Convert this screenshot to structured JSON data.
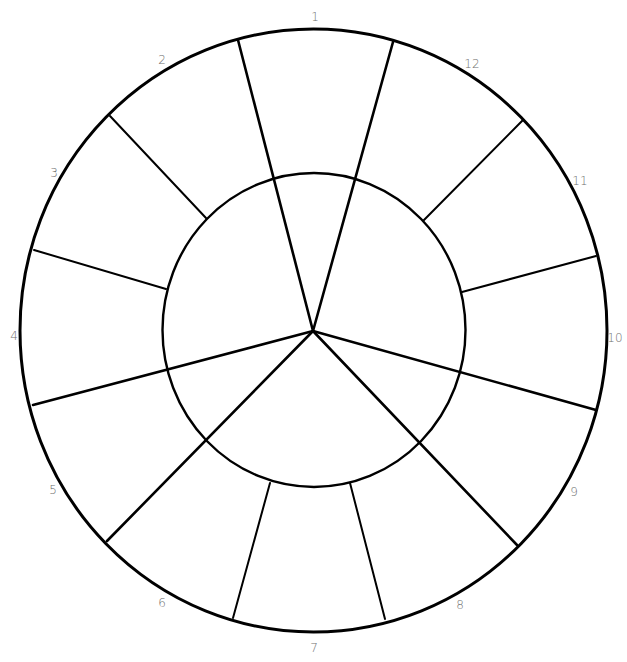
{
  "diagram": {
    "type": "color-wheel-template",
    "stroke_color": "#000000",
    "label_color": "#6f6f6f",
    "background": "#ffffff",
    "outer_ring": {
      "cx": 313.5,
      "cy": 330.5,
      "rx": 293.5,
      "ry": 301.5
    },
    "inner_ring": {
      "cx": 314,
      "cy": 330,
      "rx": 151.5,
      "ry": 157
    },
    "hub": {
      "x": 313,
      "y": 331
    },
    "segment_count": 12,
    "inner_sections": 3,
    "labels": [
      {
        "id": 1,
        "text": "1",
        "x": 315,
        "y": 17
      },
      {
        "id": 2,
        "text": "2",
        "x": 162,
        "y": 60
      },
      {
        "id": 3,
        "text": "3",
        "x": 54,
        "y": 173
      },
      {
        "id": 4,
        "text": "4",
        "x": 14,
        "y": 336
      },
      {
        "id": 5,
        "text": "5",
        "x": 53,
        "y": 490
      },
      {
        "id": 6,
        "text": "6",
        "x": 162,
        "y": 603
      },
      {
        "id": 7,
        "text": "7",
        "x": 314,
        "y": 648
      },
      {
        "id": 8,
        "text": "8",
        "x": 460,
        "y": 605
      },
      {
        "id": 9,
        "text": "9",
        "x": 574,
        "y": 492
      },
      {
        "id": 10,
        "text": "10",
        "x": 615,
        "y": 338
      },
      {
        "id": 11,
        "text": "11",
        "x": 580,
        "y": 181
      },
      {
        "id": 12,
        "text": "12",
        "x": 472,
        "y": 64
      }
    ],
    "hub_spokes": [
      {
        "name": "spoke-1-2",
        "x2": 238,
        "y2": 40
      },
      {
        "name": "spoke-12-1",
        "x2": 393,
        "y2": 42
      },
      {
        "name": "spoke-4-5",
        "x2": 33,
        "y2": 405
      },
      {
        "name": "spoke-5-6",
        "x2": 107,
        "y2": 541
      },
      {
        "name": "spoke-8-9",
        "x2": 517,
        "y2": 545
      },
      {
        "name": "spoke-9-10",
        "x2": 596,
        "y2": 410
      }
    ],
    "ring_spokes": [
      {
        "name": "spoke-2-3",
        "x1": 206,
        "y1": 218,
        "x2": 110,
        "y2": 116
      },
      {
        "name": "spoke-3-4",
        "x1": 166,
        "y1": 289,
        "x2": 34,
        "y2": 250
      },
      {
        "name": "spoke-11-12",
        "x1": 424,
        "y1": 220,
        "x2": 523,
        "y2": 120
      },
      {
        "name": "spoke-10-11",
        "x1": 462,
        "y1": 292,
        "x2": 596,
        "y2": 256
      },
      {
        "name": "spoke-6-7",
        "x1": 270,
        "y1": 483,
        "x2": 233,
        "y2": 618
      },
      {
        "name": "spoke-7-8",
        "x1": 350,
        "y1": 483,
        "x2": 385,
        "y2": 619
      }
    ]
  }
}
